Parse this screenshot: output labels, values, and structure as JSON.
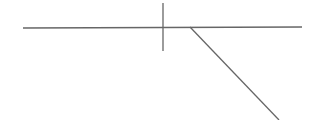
{
  "diagram": {
    "background": "#ffffff",
    "stroke_color": "#666666",
    "stroke_width": 1.3,
    "lines": [
      {
        "name": "horizontal-line",
        "x1": 23,
        "y1": 28,
        "x2": 302,
        "y2": 27
      },
      {
        "name": "vertical-tick",
        "x1": 163,
        "y1": 3,
        "x2": 163,
        "y2": 51
      },
      {
        "name": "diagonal-line",
        "x1": 190,
        "y1": 27,
        "x2": 279,
        "y2": 120
      }
    ]
  }
}
